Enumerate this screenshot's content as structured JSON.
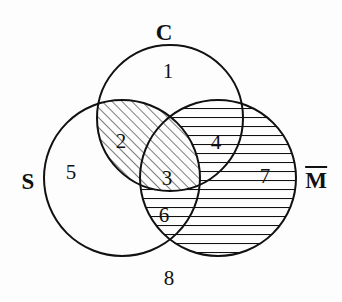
{
  "figure": {
    "type": "venn-diagram",
    "sets_count": 3,
    "background_color": "#fdfdfd",
    "stroke_color": "#111111",
    "width": 342,
    "height": 302
  },
  "sets": [
    {
      "id": "C",
      "label": "C",
      "label_x": 164,
      "label_y": 32,
      "overbar": false,
      "cx": 170,
      "cy": 118,
      "r": 73
    },
    {
      "id": "S",
      "label": "S",
      "label_x": 28,
      "label_y": 181,
      "overbar": false,
      "cx": 122,
      "cy": 178,
      "r": 78
    },
    {
      "id": "M",
      "label": "M",
      "label_x": 316,
      "label_y": 179,
      "overbar": true,
      "cx": 218,
      "cy": 178,
      "r": 78
    }
  ],
  "regions": [
    {
      "id": "r1",
      "label": "1",
      "membership": "C only",
      "shading": "none",
      "x": 168,
      "y": 71
    },
    {
      "id": "r2",
      "label": "2",
      "membership": "S and C",
      "shading": "diagonal",
      "x": 121,
      "y": 141
    },
    {
      "id": "r3",
      "label": "3",
      "membership": "S, C and M",
      "shading": "diagonal",
      "x": 167,
      "y": 178
    },
    {
      "id": "r4",
      "label": "4",
      "membership": "C and M",
      "shading": "none",
      "x": 216,
      "y": 142
    },
    {
      "id": "r5",
      "label": "5",
      "membership": "S only",
      "shading": "none",
      "x": 71,
      "y": 172
    },
    {
      "id": "r6",
      "label": "6",
      "membership": "S and M",
      "shading": "horizontal",
      "x": 164,
      "y": 215
    },
    {
      "id": "r7",
      "label": "7",
      "membership": "M and C",
      "shading": "horizontal",
      "x": 265,
      "y": 176
    },
    {
      "id": "r8",
      "label": "8",
      "membership": "outside all",
      "shading": "none",
      "x": 169,
      "y": 278
    }
  ],
  "shading_styles": {
    "diagonal": {
      "description": "45 degree hatch lines rising to the right",
      "color": "#111111",
      "spacing": 7,
      "angle_degrees": 45
    },
    "horizontal": {
      "description": "horizontal hatch lines",
      "color": "#111111",
      "spacing": 9,
      "angle_degrees": 0
    }
  }
}
